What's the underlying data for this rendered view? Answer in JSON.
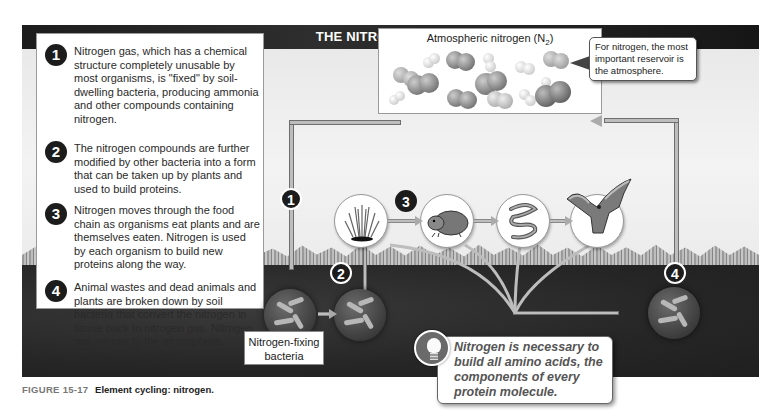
{
  "diagram": {
    "title": "THE NITROGEN CYCLE",
    "steps": [
      {
        "num": "1",
        "text": "Nitrogen gas, which has a chemical structure completely unusable by most organisms, is \"fixed\" by soil-dwelling bacteria, producing ammonia and other compounds containing nitrogen."
      },
      {
        "num": "2",
        "text": "The nitrogen compounds are further modified by other bacteria into a form that can be taken up by plants and used to build proteins."
      },
      {
        "num": "3",
        "text": "Nitrogen moves through the food chain as organisms eat plants and are themselves eaten. Nitrogen is used by each organism to build new proteins along the way."
      },
      {
        "num": "4",
        "text": "Animal wastes and dead animals and plants are broken down by soil bacteria that convert the nitrogen in tissue back to nitrogen gas. Nitrogen gas returns to the atmosphere."
      }
    ],
    "atmosphere": {
      "label": "Atmospheric nitrogen (N",
      "subscript": "2",
      "suffix": ")"
    },
    "reservoir_callout": "For nitrogen, the most important reservoir is the atmosphere.",
    "markers": {
      "m1": "1",
      "m2": "2",
      "m3": "3",
      "m4": "4"
    },
    "organisms": [
      {
        "name": "grass",
        "icon": "grass-icon"
      },
      {
        "name": "gopher",
        "icon": "gopher-icon"
      },
      {
        "name": "snake",
        "icon": "snake-icon"
      },
      {
        "name": "hawk",
        "icon": "hawk-icon"
      }
    ],
    "bacteria_label": "Nitrogen-fixing bacteria",
    "fact_callout": "Nitrogen is necessary to build all amino acids, the components of every protein molecule."
  },
  "caption": {
    "figure_number": "FIGURE 15-17",
    "title": "Element cycling: nitrogen."
  },
  "colors": {
    "title_bar": "#1d1d1d",
    "soil": "#262626",
    "pipe": "#bdbdbd",
    "marker": "#1c1c1c"
  }
}
